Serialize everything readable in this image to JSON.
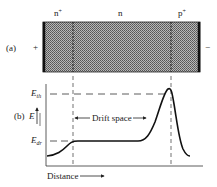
{
  "part_a": {
    "label": "(a)",
    "left_terminal": "+",
    "right_terminal": "−",
    "regions": [
      {
        "name": "n",
        "sup": "+"
      },
      {
        "name": "n",
        "sup": ""
      },
      {
        "name": "p",
        "sup": "+"
      }
    ]
  },
  "part_b": {
    "label": "(b)",
    "y_axis_label": "E",
    "levels": {
      "upper": {
        "symbol": "E",
        "subscript": "th"
      },
      "lower": {
        "symbol": "E",
        "subscript": "dr"
      }
    },
    "annotation": "Drift space",
    "x_axis_label": "Distance"
  },
  "colors": {
    "ink": "#222222",
    "fill": "#9a9a9a"
  }
}
